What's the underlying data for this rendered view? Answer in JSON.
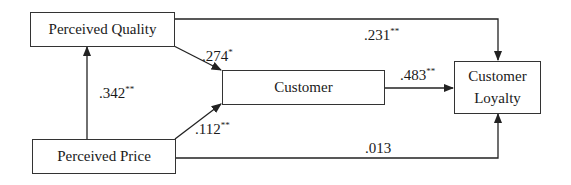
{
  "diagram": {
    "type": "path-model",
    "nodes": {
      "perceived_quality": {
        "label": "Perceived Quality"
      },
      "perceived_price": {
        "label": "Perceived Price"
      },
      "customer": {
        "label": "Customer"
      },
      "customer_loyalty": {
        "label_line1": "Customer",
        "label_line2": "Loyalty"
      }
    },
    "paths": {
      "quality_to_loyalty": {
        "from": "Perceived Quality",
        "to": "Customer Loyalty",
        "coef": ".231",
        "sig": "**"
      },
      "quality_to_customer": {
        "from": "Perceived Quality",
        "to": "Customer",
        "coef": ".274",
        "sig": "*"
      },
      "price_to_quality": {
        "from": "Perceived Price",
        "to": "Perceived Quality",
        "coef": ".342",
        "sig": "**"
      },
      "price_to_customer": {
        "from": "Perceived Price",
        "to": "Customer",
        "coef": ".112",
        "sig": "**"
      },
      "customer_to_loyalty": {
        "from": "Customer",
        "to": "Customer Loyalty",
        "coef": ".483",
        "sig": "**"
      },
      "price_to_loyalty": {
        "from": "Perceived Price",
        "to": "Customer Loyalty",
        "coef": ".013",
        "sig": ""
      }
    },
    "colors": {
      "line": "#222222",
      "box_border": "#333333",
      "background": "#ffffff"
    }
  }
}
